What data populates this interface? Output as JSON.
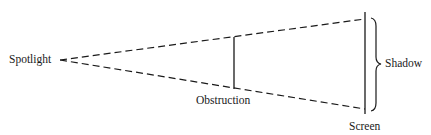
{
  "diagram": {
    "type": "optics-shadow",
    "labels": {
      "source": "Spotlight",
      "obstruction": "Obstruction",
      "screen": "Screen",
      "shadow": "Shadow"
    },
    "colors": {
      "ink": "#1a1a1a",
      "background": "#ffffff"
    }
  }
}
